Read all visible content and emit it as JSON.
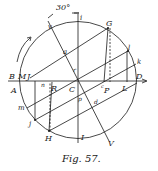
{
  "figure": {
    "caption": "Fig. 57.",
    "angle_label": "30°",
    "colors": {
      "ink": "#1a1a1a",
      "background": "#ffffff"
    }
  },
  "labels": {
    "B": "B",
    "M": "M",
    "J": "J",
    "A": "A",
    "m": "m",
    "j": "j",
    "n": "n",
    "R": "R",
    "C": "C",
    "H": "H",
    "I": "I",
    "v": "v",
    "a": "a",
    "r": "r",
    "i": "i",
    "G": "G",
    "l": "l",
    "k": "k",
    "D": "D",
    "P": "P",
    "L": "L",
    "p": "p",
    "d": "d",
    "V": "V",
    "small_c": "c"
  }
}
